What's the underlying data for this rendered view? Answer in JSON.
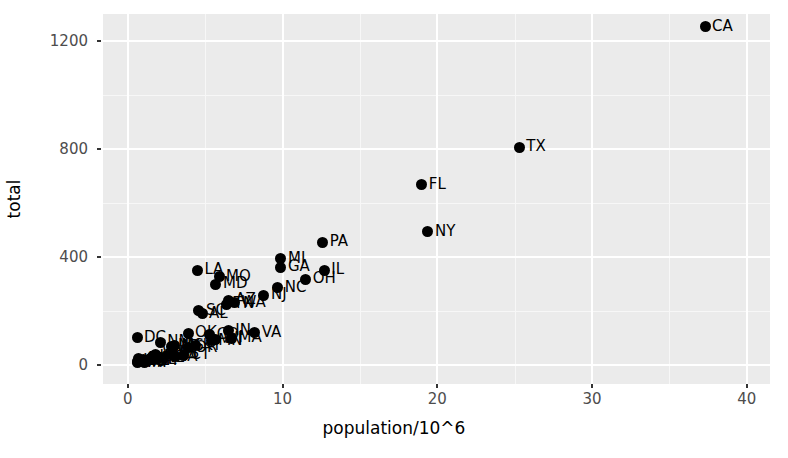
{
  "chart_data": {
    "type": "scatter",
    "title": "",
    "xlabel": "population/10^6",
    "ylabel": "total",
    "xlim": [
      -1.6,
      41.5
    ],
    "ylim": [
      -70,
      1300
    ],
    "xticks": [
      0,
      10,
      20,
      30,
      40
    ],
    "xticklabels": [
      "0",
      "10",
      "20",
      "30",
      "40"
    ],
    "yticks": [
      0,
      400,
      800,
      1200
    ],
    "yticklabels": [
      "0",
      "400",
      "800",
      "1200"
    ],
    "x_minor_ticks": [
      5,
      15,
      25,
      35
    ],
    "y_minor_ticks": [
      200,
      600,
      1000
    ],
    "grid": true,
    "legend": "none",
    "point_color": "#000000",
    "panel_background": "#ebebeb",
    "gridline_color": "#ffffff",
    "axis_text_color": "#4d4d4d",
    "labelled_points": [
      {
        "label": "CA",
        "x": 37.3,
        "y": 1253
      },
      {
        "label": "TX",
        "x": 25.3,
        "y": 806
      },
      {
        "label": "FL",
        "x": 19.0,
        "y": 668
      },
      {
        "label": "NY",
        "x": 19.4,
        "y": 494
      },
      {
        "label": "PA",
        "x": 12.6,
        "y": 455
      },
      {
        "label": "MI",
        "x": 9.9,
        "y": 393
      },
      {
        "label": "GA",
        "x": 9.9,
        "y": 362
      },
      {
        "label": "IL",
        "x": 12.7,
        "y": 352
      },
      {
        "label": "OH",
        "x": 11.5,
        "y": 318
      },
      {
        "label": "LA",
        "x": 4.5,
        "y": 352
      },
      {
        "label": "MO",
        "x": 5.9,
        "y": 328
      },
      {
        "label": "MD",
        "x": 5.7,
        "y": 300
      },
      {
        "label": "NC",
        "x": 9.7,
        "y": 287
      },
      {
        "label": "NJ",
        "x": 8.8,
        "y": 258
      },
      {
        "label": "SC",
        "x": 4.6,
        "y": 201
      },
      {
        "label": "AZ",
        "x": 6.5,
        "y": 240
      },
      {
        "label": "WA",
        "x": 6.9,
        "y": 230
      },
      {
        "label": "TN",
        "x": 6.4,
        "y": 225
      },
      {
        "label": "AL",
        "x": 4.8,
        "y": 190
      },
      {
        "label": "IN",
        "x": 6.5,
        "y": 128
      },
      {
        "label": "VA",
        "x": 8.2,
        "y": 120
      },
      {
        "label": "MN",
        "x": 5.4,
        "y": 90
      },
      {
        "label": "WI",
        "x": 5.7,
        "y": 95
      },
      {
        "label": "DC",
        "x": 0.6,
        "y": 101
      },
      {
        "label": "CO",
        "x": 5.3,
        "y": 112
      },
      {
        "label": "OK",
        "x": 3.9,
        "y": 118
      },
      {
        "label": "MA",
        "x": 6.7,
        "y": 100
      },
      {
        "label": "NM",
        "x": 2.1,
        "y": 84
      },
      {
        "label": "KY",
        "x": 4.4,
        "y": 72
      },
      {
        "label": "AR",
        "x": 2.9,
        "y": 66
      },
      {
        "label": "MS",
        "x": 3.0,
        "y": 72
      },
      {
        "label": "OR",
        "x": 3.9,
        "y": 64
      },
      {
        "label": "NV",
        "x": 2.8,
        "y": 70
      },
      {
        "label": "CT",
        "x": 3.6,
        "y": 36
      },
      {
        "label": "UT",
        "x": 2.9,
        "y": 44
      },
      {
        "label": "KS",
        "x": 2.9,
        "y": 40
      },
      {
        "label": "IA",
        "x": 3.1,
        "y": 30
      },
      {
        "label": "WV",
        "x": 1.8,
        "y": 40
      },
      {
        "label": "NE",
        "x": 1.9,
        "y": 26
      },
      {
        "label": "ID",
        "x": 1.6,
        "y": 30
      },
      {
        "label": "ME",
        "x": 1.3,
        "y": 18
      },
      {
        "label": "NH",
        "x": 1.3,
        "y": 16
      },
      {
        "label": "HI",
        "x": 1.4,
        "y": 22
      },
      {
        "label": "MT",
        "x": 1.0,
        "y": 20
      },
      {
        "label": "AK",
        "x": 0.7,
        "y": 24
      },
      {
        "label": "SD",
        "x": 0.8,
        "y": 14
      },
      {
        "label": "ND",
        "x": 0.7,
        "y": 12
      },
      {
        "label": "DE",
        "x": 0.9,
        "y": 16
      },
      {
        "label": "WY",
        "x": 0.6,
        "y": 14
      },
      {
        "label": "VT",
        "x": 0.6,
        "y": 8
      },
      {
        "label": "RI",
        "x": 1.1,
        "y": 8
      }
    ]
  }
}
